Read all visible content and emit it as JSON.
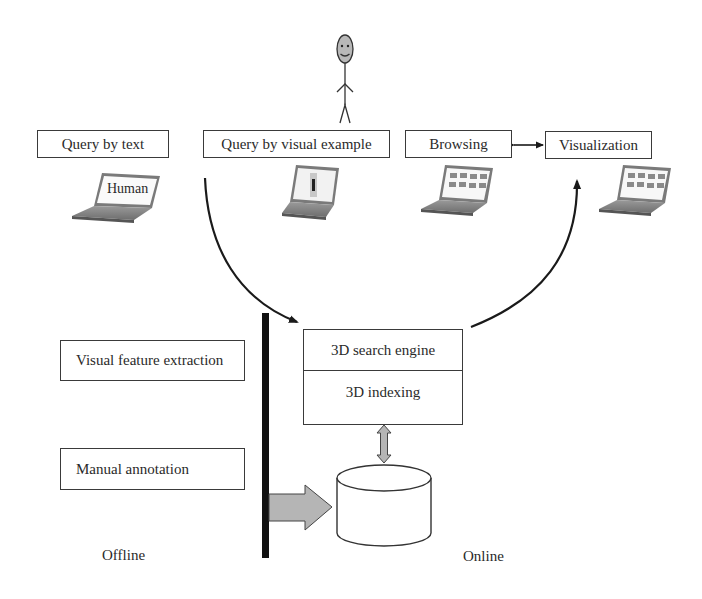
{
  "diagram": {
    "top_row": {
      "query_by_text": "Query by text",
      "query_by_visual_example": "Query by visual example",
      "browsing": "Browsing",
      "visualization": "Visualization"
    },
    "laptop_labels": {
      "query_by_text_laptop": "Human"
    },
    "offline_boxes": {
      "visual_feature_extraction": "Visual feature extraction",
      "manual_annotation": "Manual annotation"
    },
    "engine": {
      "search_engine": "3D search engine",
      "indexing": "3D indexing"
    },
    "zones": {
      "offline": "Offline",
      "online": "Online"
    },
    "icons": {
      "user": "stick-figure-person-icon",
      "laptop": "laptop-icon",
      "database": "database-cylinder-icon"
    },
    "colors": {
      "stroke": "#3a3a3a",
      "arrow_fill": "#b5b5b5",
      "divider": "#111111",
      "screen_tile": "#8a8a8a"
    }
  }
}
